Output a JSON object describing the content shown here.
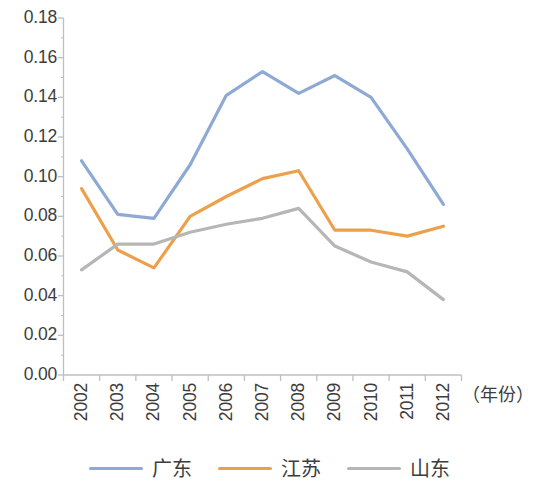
{
  "chart_data": {
    "type": "line",
    "title": "",
    "xlabel": "（年份）",
    "ylabel": "",
    "categories": [
      "2002",
      "2003",
      "2004",
      "2005",
      "2006",
      "2007",
      "2008",
      "2009",
      "2010",
      "2011",
      "2012"
    ],
    "series": [
      {
        "name": "广东",
        "color": "#8ea9d4",
        "values": [
          0.108,
          0.081,
          0.079,
          0.106,
          0.141,
          0.153,
          0.142,
          0.151,
          0.14,
          0.114,
          0.086
        ]
      },
      {
        "name": "江苏",
        "color": "#eda04b",
        "values": [
          0.094,
          0.063,
          0.054,
          0.08,
          0.09,
          0.099,
          0.103,
          0.073,
          0.073,
          0.07,
          0.075
        ]
      },
      {
        "name": "山东",
        "color": "#b6b6b6",
        "values": [
          0.053,
          0.066,
          0.066,
          0.072,
          0.076,
          0.079,
          0.084,
          0.065,
          0.057,
          0.052,
          0.038
        ]
      }
    ],
    "ylim": [
      0.0,
      0.18
    ],
    "ytick_values": [
      "0.00",
      "0.02",
      "0.04",
      "0.06",
      "0.08",
      "0.10",
      "0.12",
      "0.14",
      "0.16",
      "0.18"
    ],
    "grid": false,
    "legend_position": "bottom",
    "axis_color": "#bfbfbf"
  },
  "legend": {
    "items": [
      {
        "label": "广东",
        "color": "#8ea9d4"
      },
      {
        "label": "江苏",
        "color": "#eda04b"
      },
      {
        "label": "山东",
        "color": "#b6b6b6"
      }
    ]
  }
}
